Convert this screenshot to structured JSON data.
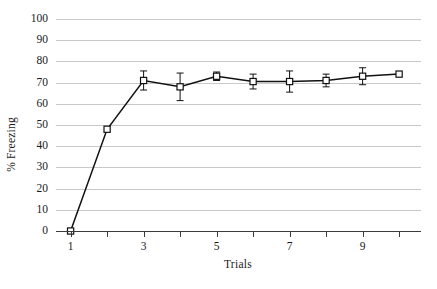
{
  "chart_data": {
    "type": "line",
    "title": "",
    "xlabel": "Trials",
    "ylabel": "% Freezing",
    "x": [
      1,
      2,
      3,
      4,
      5,
      6,
      7,
      8,
      9,
      10
    ],
    "values": [
      0,
      48,
      71,
      68,
      73,
      70.5,
      70.5,
      71,
      73,
      74
    ],
    "errors": [
      0,
      0,
      4.5,
      6.5,
      2,
      3.5,
      5,
      3,
      4,
      0
    ],
    "xlim": [
      0.6,
      10.6
    ],
    "ylim": [
      0,
      100
    ],
    "ytick_values": [
      0,
      10,
      20,
      30,
      40,
      50,
      60,
      70,
      80,
      90,
      100
    ],
    "ytick_labels": [
      "0",
      "10",
      "20",
      "30",
      "40",
      "50",
      "60",
      "70",
      "80",
      "90",
      "100"
    ],
    "xtick_values": [
      1,
      2,
      3,
      4,
      5,
      6,
      7,
      8,
      9,
      10
    ],
    "xtick_labels": [
      "1",
      "",
      "3",
      "",
      "5",
      "",
      "7",
      "",
      "9",
      ""
    ],
    "grid": "horizontal",
    "legend": "none",
    "marker": "open-square",
    "line_color": "#111111",
    "grid_color": "#c9c9c9",
    "marker_fill": "#ffffff",
    "background": "#ffffff"
  }
}
